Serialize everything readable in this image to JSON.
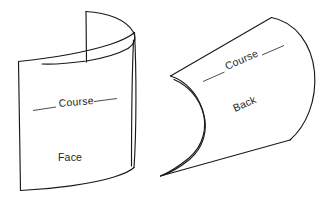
{
  "figure": {
    "background_color": "#ffffff",
    "line_color": "#1a1a1a",
    "text_color": "#262626",
    "width": 328,
    "height": 202
  },
  "panels": [
    {
      "id": "face-panel",
      "view_label": "Face",
      "course_label": "Course",
      "description": "Curved fabric sheet shown from the face side with elliptical top edge",
      "view_label_position": {
        "x": 74,
        "y": 159
      },
      "course_label_position": {
        "x": 75,
        "y": 105
      },
      "course_label_rotation": -5
    },
    {
      "id": "back-panel",
      "view_label": "Back",
      "course_label": "Course",
      "description": "S-curved fabric sheet shown from the back side",
      "view_label_position": {
        "x": 252,
        "y": 108
      },
      "course_label_position": {
        "x": 238,
        "y": 68
      },
      "view_label_rotation": -24,
      "course_label_rotation": -24
    }
  ],
  "labels": {
    "course_left": "Course",
    "course_right": "Course",
    "face": "Face",
    "back": "Back"
  }
}
